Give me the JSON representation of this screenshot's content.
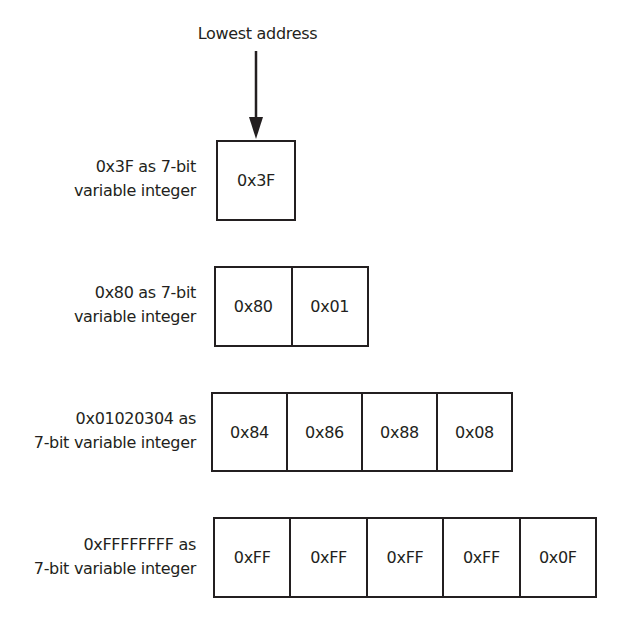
{
  "title": "Lowest address",
  "rows": [
    {
      "label": [
        "0x3F as 7-bit",
        "variable integer"
      ],
      "bytes": [
        "0x3F"
      ]
    },
    {
      "label": [
        "0x80 as 7-bit",
        "variable integer"
      ],
      "bytes": [
        "0x80",
        "0x01"
      ]
    },
    {
      "label": [
        "0x01020304 as",
        "7-bit variable integer"
      ],
      "bytes": [
        "0x84",
        "0x86",
        "0x88",
        "0x08"
      ]
    },
    {
      "label": [
        "0xFFFFFFFF as",
        "7-bit variable integer"
      ],
      "bytes": [
        "0xFF",
        "0xFF",
        "0xFF",
        "0xFF",
        "0x0F"
      ]
    }
  ],
  "icons": {
    "arrow": "arrow-down-icon"
  },
  "colors": {
    "ink": "#231f20",
    "background": "#ffffff"
  }
}
